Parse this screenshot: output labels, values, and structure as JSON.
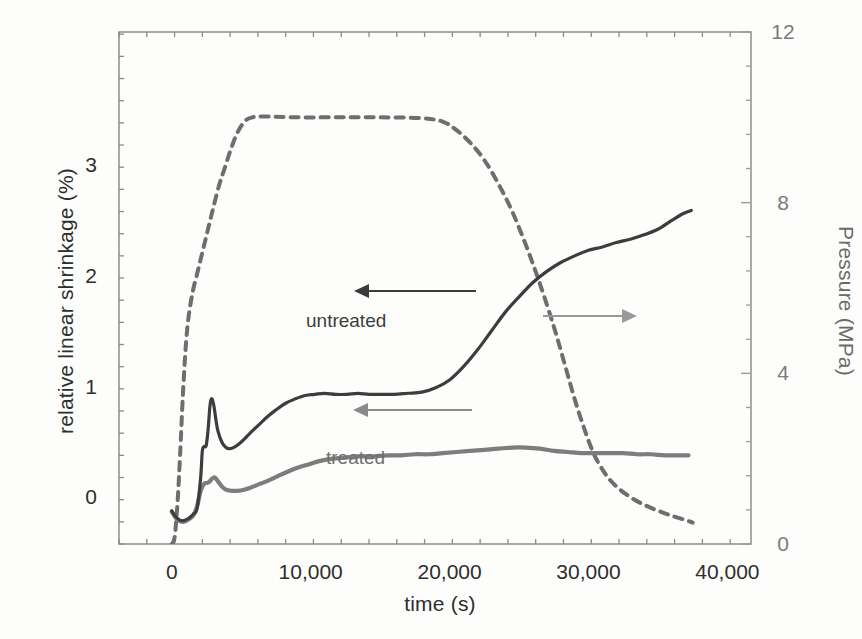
{
  "figure": {
    "background": "#fdfdfc",
    "plot_frame": {
      "left": 119,
      "top": 32,
      "right": 751,
      "bottom": 544
    }
  },
  "chart_data": {
    "type": "line",
    "title": "",
    "xlabel": "time (s)",
    "ylabel": "relative linear shrinkage (%)",
    "y2label": "Pressure (MPa)",
    "xlim": [
      -3800,
      41700
    ],
    "ylim": [
      -0.42,
      4.2
    ],
    "y2lim": [
      0,
      12
    ],
    "grid": false,
    "legend_position": "inline-annotations",
    "xticks": [
      0,
      10000,
      20000,
      30000,
      40000
    ],
    "xticklabels": [
      "0",
      "10,000",
      "20,000",
      "30,000",
      "40,000"
    ],
    "xminor_interval": 2000,
    "yticks": [
      0,
      1,
      2,
      3
    ],
    "yticklabels": [
      "0",
      "1",
      "2",
      "3"
    ],
    "yminor_interval": 0.2,
    "y2ticks": [
      0,
      4,
      8,
      12
    ],
    "y2ticklabels": [
      "0",
      "4",
      "8",
      "12"
    ],
    "y2minor_interval": 0.8,
    "series": [
      {
        "name": "untreated",
        "axis": "left",
        "style": "solid",
        "color": "#3d3d3d",
        "linewidth": 3.2,
        "x": [
          0,
          260,
          520,
          780,
          1040,
          1300,
          1560,
          1820,
          2080,
          2200,
          2340,
          2480,
          2620,
          2760,
          2900,
          3040,
          3180,
          3320,
          3600,
          3900,
          4200,
          4600,
          5000,
          5400,
          5800,
          6300,
          6900,
          7500,
          8200,
          8900,
          9600,
          10300,
          11000,
          11800,
          12600,
          13400,
          14200,
          15000,
          16000,
          17000,
          18000,
          19000,
          20000,
          21000,
          22000,
          23000,
          24000,
          25000,
          26000,
          27000,
          28000,
          29000,
          30000,
          31000,
          32000,
          33000,
          34000,
          35000,
          36000,
          36800,
          37400
        ],
        "y": [
          -0.12,
          -0.17,
          -0.2,
          -0.21,
          -0.2,
          -0.18,
          -0.15,
          -0.1,
          0.18,
          0.42,
          0.46,
          0.47,
          0.62,
          0.84,
          0.89,
          0.82,
          0.7,
          0.6,
          0.5,
          0.45,
          0.44,
          0.46,
          0.5,
          0.55,
          0.6,
          0.66,
          0.73,
          0.79,
          0.85,
          0.89,
          0.92,
          0.93,
          0.94,
          0.93,
          0.93,
          0.94,
          0.93,
          0.93,
          0.93,
          0.94,
          0.95,
          0.99,
          1.06,
          1.18,
          1.33,
          1.5,
          1.67,
          1.81,
          1.94,
          2.04,
          2.12,
          2.18,
          2.23,
          2.26,
          2.3,
          2.33,
          2.37,
          2.42,
          2.5,
          2.56,
          2.59
        ]
      },
      {
        "name": "treated",
        "axis": "left",
        "style": "solid",
        "color": "#7d7d7d",
        "linewidth": 4.2,
        "x": [
          0,
          260,
          520,
          780,
          1040,
          1300,
          1560,
          1820,
          2080,
          2300,
          2500,
          2700,
          2900,
          3100,
          3300,
          3600,
          3900,
          4300,
          4700,
          5200,
          5700,
          6300,
          6900,
          7600,
          8300,
          9100,
          9900,
          10700,
          11600,
          12500,
          13500,
          14500,
          15500,
          16500,
          17500,
          18500,
          19500,
          20500,
          21500,
          22500,
          23500,
          24500,
          25500,
          26500,
          27500,
          28500,
          29500,
          30500,
          31500,
          32500,
          33500,
          34500,
          35500,
          36400,
          37200
        ],
        "y": [
          -0.13,
          -0.18,
          -0.21,
          -0.22,
          -0.21,
          -0.19,
          -0.16,
          -0.08,
          0.06,
          0.12,
          0.13,
          0.14,
          0.17,
          0.18,
          0.15,
          0.1,
          0.07,
          0.06,
          0.06,
          0.07,
          0.09,
          0.12,
          0.15,
          0.19,
          0.23,
          0.27,
          0.3,
          0.33,
          0.35,
          0.36,
          0.37,
          0.37,
          0.38,
          0.38,
          0.39,
          0.39,
          0.4,
          0.41,
          0.42,
          0.43,
          0.44,
          0.45,
          0.45,
          0.44,
          0.42,
          0.41,
          0.4,
          0.4,
          0.4,
          0.4,
          0.39,
          0.39,
          0.38,
          0.38,
          0.38
        ]
      },
      {
        "name": "pressure",
        "axis": "right",
        "style": "dashed",
        "color": "#6e6e6e",
        "linewidth": 4.0,
        "x": [
          0,
          200,
          400,
          600,
          800,
          1000,
          1200,
          1500,
          1800,
          2100,
          2400,
          2700,
          3000,
          3400,
          3800,
          4200,
          4600,
          5000,
          5400,
          5800,
          6200,
          7000,
          9000,
          12000,
          15000,
          18000,
          19500,
          20500,
          21500,
          22500,
          23500,
          24500,
          25500,
          26500,
          27500,
          28300,
          29000,
          29700,
          30400,
          31200,
          32000,
          33000,
          34000,
          35000,
          36000,
          37000,
          37500
        ],
        "y": [
          0.0,
          0.15,
          0.9,
          2.1,
          3.5,
          4.6,
          5.3,
          5.9,
          6.3,
          6.7,
          7.1,
          7.5,
          7.9,
          8.4,
          8.8,
          9.2,
          9.55,
          9.8,
          9.95,
          10.0,
          10.02,
          10.02,
          10.0,
          10.0,
          10.0,
          9.98,
          9.9,
          9.7,
          9.4,
          9.0,
          8.45,
          7.8,
          7.0,
          6.1,
          5.1,
          4.2,
          3.4,
          2.7,
          2.1,
          1.65,
          1.35,
          1.1,
          0.92,
          0.78,
          0.66,
          0.56,
          0.5
        ]
      }
    ],
    "annotations": [
      {
        "name": "untreated",
        "text": "untreated",
        "x": 306,
        "y": 310,
        "color": "#3d3d3d"
      },
      {
        "name": "treated",
        "text": "treated",
        "x": 326,
        "y": 447,
        "color": "#6f6f6f"
      }
    ],
    "arrows": [
      {
        "name": "untreated-arrow",
        "direction": "left",
        "color": "#3a3a3a",
        "x1": 476,
        "x2": 354,
        "y": 291
      },
      {
        "name": "treated-arrow",
        "direction": "left",
        "color": "#8a8a8a",
        "x1": 472,
        "x2": 353,
        "y": 410
      },
      {
        "name": "pressure-arrow",
        "direction": "right",
        "color": "#9a9a9a",
        "x1": 543,
        "x2": 637,
        "y": 316
      }
    ]
  }
}
